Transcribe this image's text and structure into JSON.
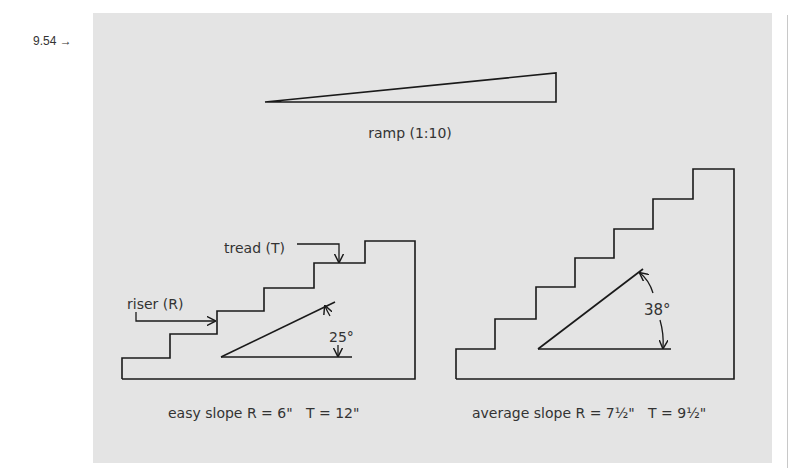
{
  "figure": {
    "number_label": "9.54 →"
  },
  "ramp": {
    "label": "ramp (1:10)"
  },
  "easy_stair": {
    "tread_label": "tread (T)",
    "riser_label": "riser (R)",
    "angle_label": "25°",
    "caption": "easy slope R = 6\"   T = 12\""
  },
  "average_stair": {
    "angle_label": "38°",
    "caption": "average slope R = 7½\"   T = 9½\""
  },
  "colors": {
    "panel_bg": "#e4e4e4",
    "line": "#1a1a1a",
    "text": "#333333"
  }
}
